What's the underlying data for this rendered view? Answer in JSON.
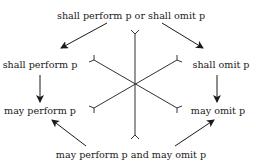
{
  "diagram": {
    "type": "deontic-hexagon",
    "nodes": {
      "top": {
        "label": "shall perform p or shall omit p"
      },
      "upper_left": {
        "label": "shall perform p"
      },
      "upper_right": {
        "label": "shall omit p"
      },
      "lower_left": {
        "label": "may perform p"
      },
      "lower_right": {
        "label": "may omit p"
      },
      "bottom": {
        "label": "may perform p and may omit p"
      }
    },
    "arrows": [
      {
        "from": "top",
        "to": "upper_left"
      },
      {
        "from": "top",
        "to": "upper_right"
      },
      {
        "from": "upper_left",
        "to": "lower_left"
      },
      {
        "from": "upper_right",
        "to": "lower_right"
      },
      {
        "from": "bottom",
        "to": "lower_left"
      },
      {
        "from": "bottom",
        "to": "lower_right"
      }
    ],
    "contradiction_lines": [
      {
        "between": [
          "top",
          "bottom"
        ]
      },
      {
        "between": [
          "upper_left",
          "lower_right"
        ]
      },
      {
        "between": [
          "upper_right",
          "lower_left"
        ]
      }
    ],
    "colors": {
      "text": "#1a1a1a",
      "line": "#333333",
      "background": "#ffffff"
    }
  }
}
